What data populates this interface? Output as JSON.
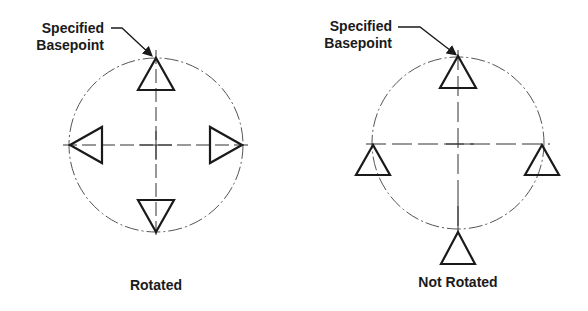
{
  "diagrams": [
    {
      "id": "rotated",
      "caption": "Rotated",
      "callout_line1": "Specified",
      "callout_line2": "Basepoint",
      "center": [
        156,
        145
      ],
      "radius": 87
    },
    {
      "id": "not-rotated",
      "caption": "Not Rotated",
      "callout_line1": "Specified",
      "callout_line2": "Basepoint",
      "center": [
        458,
        145
      ],
      "radius": 85
    }
  ],
  "colors": {
    "stroke": "#1a1a1a",
    "centerline": "#333333",
    "circle": "#555555",
    "background": "#ffffff"
  }
}
